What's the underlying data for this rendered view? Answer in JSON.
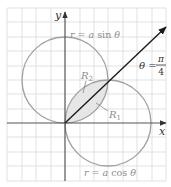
{
  "figure": {
    "type": "polar-curves-diagram",
    "axes": {
      "x_label": "x",
      "y_label": "y"
    },
    "curves": [
      {
        "name": "upper-circle",
        "equation_lhs": "r = ",
        "equation_a": "a",
        "equation_fn": " sin ",
        "equation_theta": "θ",
        "full": "r = a sin θ"
      },
      {
        "name": "right-circle",
        "equation_lhs": "r = ",
        "equation_a": "a",
        "equation_fn": " cos ",
        "equation_theta": "θ",
        "full": "r = a cos θ"
      }
    ],
    "ray": {
      "label_theta": "θ",
      "label_eq": " = ",
      "label_num": "π",
      "label_den": "4",
      "full": "θ = π/4"
    },
    "regions": [
      {
        "name": "R1",
        "letter": "R",
        "subscript": "1"
      },
      {
        "name": "R2",
        "letter": "R",
        "subscript": "2"
      }
    ],
    "colors": {
      "grid": "#d9d9d9",
      "axis": "#555555",
      "curve": "#a0a0a0",
      "ray": "#1a1a1a",
      "shade": "#e6e6e6",
      "label_gray": "#8c8c8c",
      "label_dark": "#333333"
    }
  }
}
